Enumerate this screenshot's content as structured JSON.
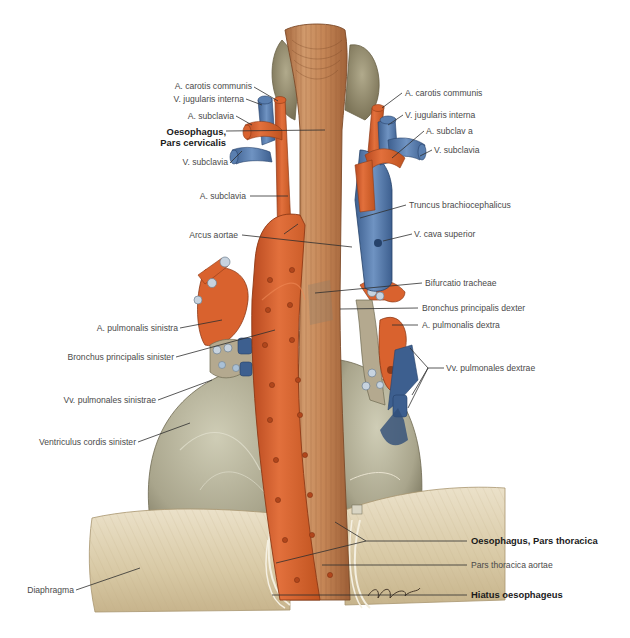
{
  "figure": {
    "colors": {
      "background": "#ffffff",
      "artery": "#d9622e",
      "artery_dark": "#a8441d",
      "vein": "#5a7fb0",
      "vein_dark": "#3d5f8f",
      "oesophagus": "#c98a5c",
      "oesophagus_dark": "#a86a40",
      "heart": "#a9a58c",
      "heart_light": "#c9c7b0",
      "diaphragm": "#d6c7a4",
      "diaphragm_light": "#e8dcc0",
      "thyroid": "#9f9778",
      "bronchus": "#b9c8d6",
      "leader_line": "#2e2e2e",
      "label_text": "#4a4a4a",
      "label_text_bold": "#1a1a1a"
    }
  },
  "labels": {
    "left": [
      {
        "id": "a-carotis-communis-left",
        "text": "A. carotis communis",
        "bold": false
      },
      {
        "id": "v-jugularis-interna-left",
        "text": "V. jugularis interna",
        "bold": false
      },
      {
        "id": "a-subclavia-left-upper",
        "text": "A. subclavia",
        "bold": false
      },
      {
        "id": "oesophagus-pars-cervicalis",
        "text": "Oesophagus,",
        "text2": "Pars cervicalis",
        "bold": true
      },
      {
        "id": "v-subclavia-left",
        "text": "V. subclavia",
        "bold": false
      },
      {
        "id": "a-subclavia-left-lower",
        "text": "A. subclavia",
        "bold": false
      },
      {
        "id": "arcus-aortae",
        "text": "Arcus aortae",
        "bold": false
      },
      {
        "id": "a-pulmonalis-sinistra",
        "text": "A. pulmonalis sinistra",
        "bold": false
      },
      {
        "id": "bronchus-principalis-sinister",
        "text": "Bronchus principalis sinister",
        "bold": false
      },
      {
        "id": "vv-pulmonales-sinistrae",
        "text": "Vv. pulmonales sinistrae",
        "bold": false
      },
      {
        "id": "ventriculus-cordis-sinister",
        "text": "Ventriculus cordis sinister",
        "bold": false
      },
      {
        "id": "diaphragma",
        "text": "Diaphragma",
        "bold": false
      }
    ],
    "right": [
      {
        "id": "a-carotis-communis-right",
        "text": "A. carotis communis",
        "bold": false
      },
      {
        "id": "v-jugularis-interna-right",
        "text": "V. jugularis interna",
        "bold": false
      },
      {
        "id": "a-subclavia-right",
        "text": "A. subclav a",
        "bold": false
      },
      {
        "id": "v-subclavia-right",
        "text": "V. subclavia",
        "bold": false
      },
      {
        "id": "truncus-brachiocephalicus",
        "text": "Truncus brachiocephalicus",
        "bold": false
      },
      {
        "id": "v-cava-superior",
        "text": "V. cava superior",
        "bold": false
      },
      {
        "id": "bifurcatio-tracheae",
        "text": "Bifurcatio tracheae",
        "bold": false
      },
      {
        "id": "bronchus-principalis-dexter",
        "text": "Bronchus principalis dexter",
        "bold": false
      },
      {
        "id": "a-pulmonalis-dextra",
        "text": "A. pulmonalis dextra",
        "bold": false
      },
      {
        "id": "vv-pulmonales-dextrae",
        "text": "Vv. pulmonales dextrae",
        "bold": false
      },
      {
        "id": "oesophagus-pars-thoracica",
        "text": "Oesophagus, Pars thoracica",
        "bold": true
      },
      {
        "id": "pars-thoracica-aortae",
        "text": "Pars thoracica aortae",
        "bold": false
      },
      {
        "id": "hiatus-oesophageus",
        "text": "Hiatus oesophageus",
        "bold": true
      }
    ]
  },
  "signature": "artist-signature"
}
